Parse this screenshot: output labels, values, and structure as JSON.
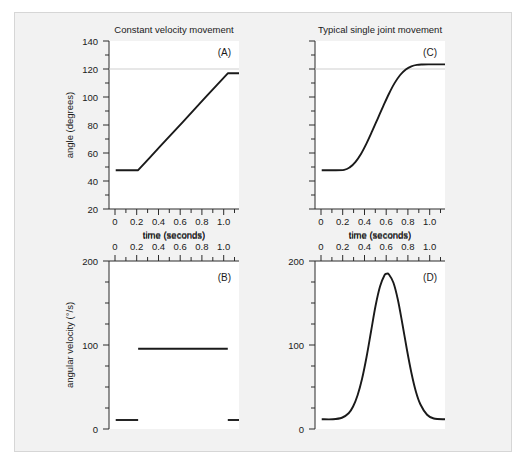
{
  "figure": {
    "background_color": "#f2f2f2",
    "border_color": "#d6d6d6",
    "plot_background_color": "#ffffff",
    "curve_color": "#1a1a1a",
    "axis_color": "#2b2b2b",
    "gridline_color": "#cfcfcf"
  },
  "axis_titles": {
    "time": "time (seconds)",
    "angle": "angle (degrees)",
    "angular_velocity": "angular velocity (°/s)"
  },
  "column_titles": {
    "left": "Constant velocity movement",
    "right": "Typical single joint movement"
  },
  "panel_labels": {
    "a": "(A)",
    "b": "(B)",
    "c": "(C)",
    "d": "(D)"
  },
  "ticks": {
    "time_major": [
      "0",
      "0.2",
      "0.4",
      "0.6",
      "0.8",
      "1.0"
    ],
    "angle_major": [
      "20",
      "40",
      "60",
      "80",
      "100",
      "120",
      "140"
    ],
    "velocity_major": [
      "0",
      "100",
      "200"
    ]
  },
  "chart_data": [
    {
      "id": "panel-a",
      "type": "line",
      "title": "Constant velocity movement",
      "panel_label": "(A)",
      "xlabel": "time (seconds)",
      "ylabel": "angle (degrees)",
      "xlim": [
        -0.06,
        1.1
      ],
      "ylim": [
        15,
        145
      ],
      "xticks": [
        0,
        0.2,
        0.4,
        0.6,
        0.8,
        1.0
      ],
      "xticklabels": [
        "0",
        "0.2",
        "0.4",
        "0.6",
        "0.8",
        "1.0"
      ],
      "yticks": [
        20,
        40,
        60,
        80,
        100,
        120,
        140
      ],
      "yticklabels": [
        "20",
        "40",
        "60",
        "80",
        "100",
        "120",
        "140"
      ],
      "minor_x_step": 0.1,
      "minor_y_step": 10,
      "grid": false,
      "hlines": [
        120
      ],
      "legend": null,
      "x": [
        0.0,
        0.05,
        0.1,
        0.15,
        0.2,
        0.3,
        0.4,
        0.5,
        0.6,
        0.7,
        0.8,
        0.9,
        1.0,
        1.05,
        1.1
      ],
      "values": [
        45,
        45,
        45,
        45,
        45,
        54.4,
        63.8,
        73.1,
        82.5,
        91.9,
        101.3,
        110.6,
        120,
        120,
        120
      ]
    },
    {
      "id": "panel-c",
      "type": "line",
      "title": "Typical single joint movement",
      "panel_label": "(C)",
      "xlabel": "time (seconds)",
      "ylabel": "",
      "xlim": [
        -0.06,
        1.1
      ],
      "ylim": [
        15,
        145
      ],
      "xticks": [
        0,
        0.2,
        0.4,
        0.6,
        0.8,
        1.0
      ],
      "xticklabels": [
        "0",
        "0.2",
        "0.4",
        "0.6",
        "0.8",
        "1.0"
      ],
      "yticks": [
        20,
        40,
        60,
        80,
        100,
        120,
        140
      ],
      "yticklabels": [],
      "minor_x_step": 0.1,
      "minor_y_step": 10,
      "grid": false,
      "hlines": [
        120
      ],
      "legend": null,
      "x": [
        0.0,
        0.1,
        0.2,
        0.25,
        0.3,
        0.35,
        0.4,
        0.45,
        0.5,
        0.55,
        0.6,
        0.65,
        0.7,
        0.75,
        0.8,
        0.85,
        0.9,
        0.95,
        1.0,
        1.1
      ],
      "values": [
        45,
        45,
        45.3,
        47.2,
        51.3,
        57.6,
        65.8,
        75.2,
        85.0,
        94.8,
        104.2,
        112.4,
        118.7,
        123.0,
        125.4,
        126.5,
        126.8,
        126.9,
        126.9,
        126.9
      ]
    },
    {
      "id": "panel-b",
      "type": "line",
      "title": "",
      "panel_label": "(B)",
      "xlabel": "time (seconds)",
      "ylabel": "angular velocity (°/s)",
      "xlim": [
        -0.06,
        1.1
      ],
      "ylim": [
        -12,
        212
      ],
      "xaxis_position": "top",
      "xticks": [
        0,
        0.2,
        0.4,
        0.6,
        0.8,
        1.0
      ],
      "xticklabels": [
        "0",
        "0.2",
        "0.4",
        "0.6",
        "0.8",
        "1.0"
      ],
      "yticks": [
        0,
        100,
        200
      ],
      "yticklabels": [
        "0",
        "100",
        "200"
      ],
      "minor_x_step": 0.1,
      "minor_y_step": 25,
      "grid": false,
      "legend": null,
      "segments": [
        {
          "x": [
            0.0,
            0.2
          ],
          "values": [
            0,
            0
          ]
        },
        {
          "x": [
            0.2,
            1.0
          ],
          "values": [
            95,
            95
          ]
        },
        {
          "x": [
            1.0,
            1.1
          ],
          "values": [
            0,
            0
          ]
        }
      ]
    },
    {
      "id": "panel-d",
      "type": "line",
      "title": "",
      "panel_label": "(D)",
      "xlabel": "time (seconds)",
      "ylabel": "",
      "xlim": [
        -0.06,
        1.1
      ],
      "ylim": [
        -12,
        212
      ],
      "xaxis_position": "top",
      "xticks": [
        0,
        0.2,
        0.4,
        0.6,
        0.8,
        1.0
      ],
      "xticklabels": [
        "0",
        "0.2",
        "0.4",
        "0.6",
        "0.8",
        "1.0"
      ],
      "yticks": [
        0,
        100,
        200
      ],
      "yticklabels": [
        "0",
        "100",
        "200"
      ],
      "minor_x_step": 0.1,
      "minor_y_step": 25,
      "grid": false,
      "legend": null,
      "peak": {
        "x": 0.58,
        "y": 195
      },
      "x": [
        0.0,
        0.1,
        0.18,
        0.24,
        0.28,
        0.32,
        0.36,
        0.4,
        0.44,
        0.48,
        0.52,
        0.56,
        0.58,
        0.6,
        0.64,
        0.68,
        0.72,
        0.76,
        0.8,
        0.84,
        0.88,
        0.94,
        1.0,
        1.1
      ],
      "values": [
        1,
        1,
        3,
        9,
        18,
        33,
        55,
        84,
        118,
        152,
        178,
        193,
        195,
        194,
        183,
        160,
        128,
        94,
        63,
        38,
        21,
        7,
        2,
        1
      ]
    }
  ]
}
